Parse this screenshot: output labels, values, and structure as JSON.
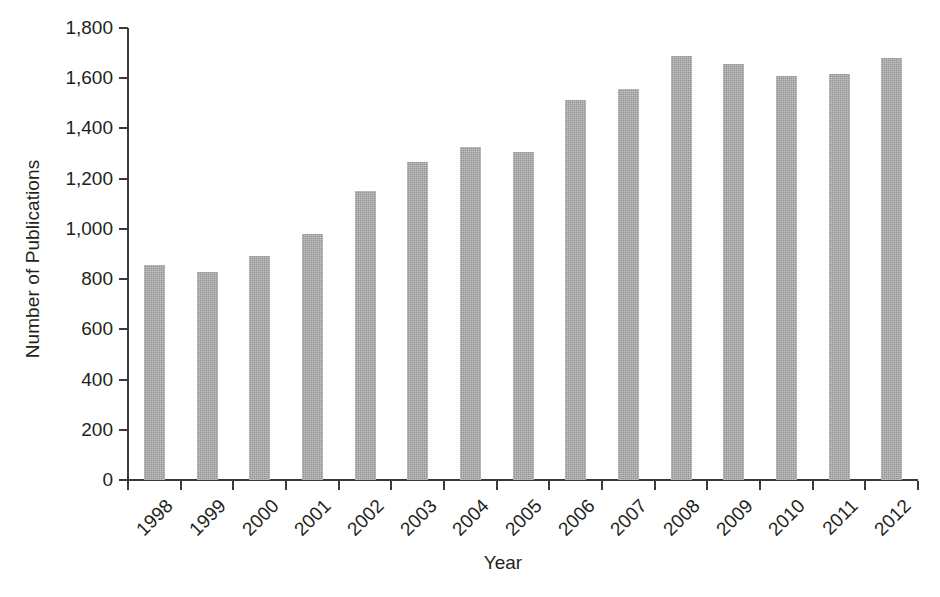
{
  "chart_data": {
    "type": "bar",
    "title": "",
    "xlabel": "Year",
    "ylabel": "Number of Publications",
    "categories": [
      "1998",
      "1999",
      "2000",
      "2001",
      "2002",
      "2003",
      "2004",
      "2005",
      "2006",
      "2007",
      "2008",
      "2009",
      "2010",
      "2011",
      "2012"
    ],
    "values": [
      855,
      830,
      893,
      980,
      1150,
      1268,
      1325,
      1308,
      1515,
      1558,
      1688,
      1655,
      1610,
      1618,
      1680
    ],
    "ylim": [
      0,
      1800
    ],
    "ytick_values": [
      0,
      200,
      400,
      600,
      800,
      1000,
      1200,
      1400,
      1600,
      1800
    ],
    "ytick_labels": [
      "0",
      "200",
      "400",
      "600",
      "800",
      "1,000",
      "1,200",
      "1,400",
      "1,600",
      "1,800"
    ],
    "grid": false,
    "legend": false,
    "legend_position": "none",
    "series": [
      {
        "name": "Number of Publications",
        "values": [
          855,
          830,
          893,
          980,
          1150,
          1268,
          1325,
          1308,
          1515,
          1558,
          1688,
          1655,
          1610,
          1618,
          1680
        ]
      }
    ],
    "colors": {
      "bar": "#a9a9a9",
      "axis": "#3a3a3c",
      "text": "#231f20",
      "background": "#ffffff"
    }
  }
}
